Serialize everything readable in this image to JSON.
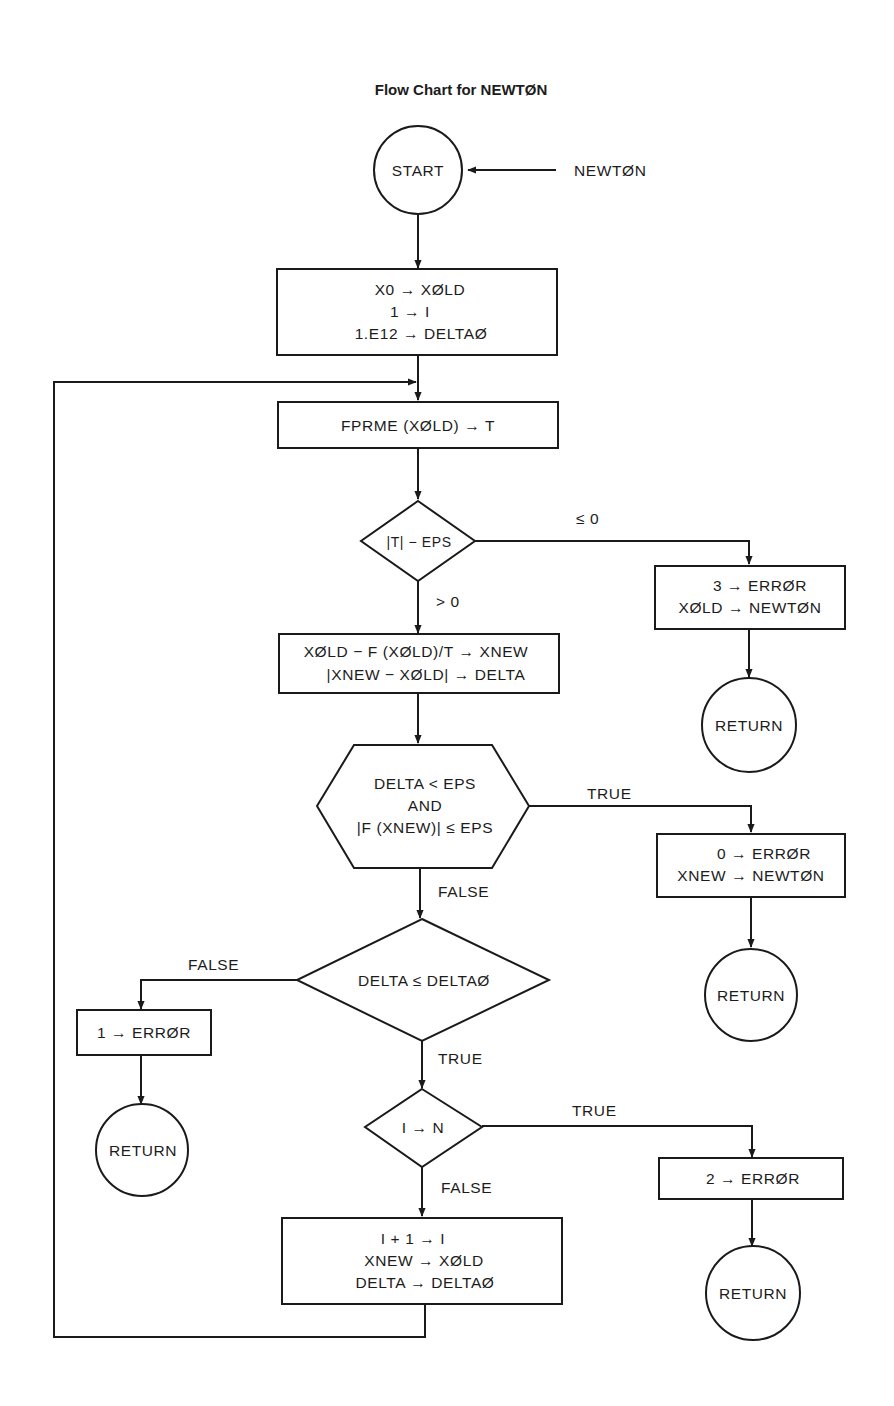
{
  "title": "Flow Chart for NEWTØN",
  "entry_label": "NEWTØN",
  "nodes": {
    "start": {
      "type": "terminal",
      "text": "START"
    },
    "init": {
      "type": "process",
      "lines": [
        "X0 → XØLD",
        "1 → I",
        "1.E12 → DELTAØ"
      ]
    },
    "fprme": {
      "type": "process",
      "lines": [
        "FPRME (XØLD) → T"
      ]
    },
    "check_t": {
      "type": "decision",
      "text": "|T| − EPS"
    },
    "err3": {
      "type": "process",
      "lines": [
        "3 → ERRØR",
        "XØLD → NEWTØN"
      ]
    },
    "return1": {
      "type": "terminal",
      "text": "RETURN"
    },
    "newton_step": {
      "type": "process",
      "lines": [
        "XØLD − F (XØLD)/T → XNEW",
        "|XNEW − XØLD| → DELTA"
      ]
    },
    "converge": {
      "type": "decision",
      "lines": [
        "DELTA < EPS",
        "AND",
        "|F (XNEW)| ≤ EPS"
      ]
    },
    "err0": {
      "type": "process",
      "lines": [
        "0 → ERRØR",
        "XNEW → NEWTØN"
      ]
    },
    "return2": {
      "type": "terminal",
      "text": "RETURN"
    },
    "delta_check": {
      "type": "decision",
      "text": "DELTA ≤ DELTAØ"
    },
    "err1": {
      "type": "process",
      "lines": [
        "1 → ERRØR"
      ]
    },
    "return3": {
      "type": "terminal",
      "text": "RETURN"
    },
    "iter_check": {
      "type": "decision",
      "text": "I → N"
    },
    "err2": {
      "type": "process",
      "lines": [
        "2 → ERRØR"
      ]
    },
    "return4": {
      "type": "terminal",
      "text": "RETURN"
    },
    "update": {
      "type": "process",
      "lines": [
        "I + 1 → I",
        "XNEW → XØLD",
        "DELTA → DELTAØ"
      ]
    }
  },
  "edge_labels": {
    "check_t_le0": "≤ 0",
    "check_t_gt0": "> 0",
    "converge_true": "TRUE",
    "converge_false": "FALSE",
    "delta_false": "FALSE",
    "delta_true": "TRUE",
    "iter_true": "TRUE",
    "iter_false": "FALSE"
  },
  "edges": [
    {
      "from": "entry",
      "to": "start"
    },
    {
      "from": "start",
      "to": "init"
    },
    {
      "from": "init",
      "to": "fprme"
    },
    {
      "from": "fprme",
      "to": "check_t"
    },
    {
      "from": "check_t",
      "to": "err3",
      "label": "≤ 0"
    },
    {
      "from": "err3",
      "to": "return1"
    },
    {
      "from": "check_t",
      "to": "newton_step",
      "label": "> 0"
    },
    {
      "from": "newton_step",
      "to": "converge"
    },
    {
      "from": "converge",
      "to": "err0",
      "label": "TRUE"
    },
    {
      "from": "err0",
      "to": "return2"
    },
    {
      "from": "converge",
      "to": "delta_check",
      "label": "FALSE"
    },
    {
      "from": "delta_check",
      "to": "err1",
      "label": "FALSE"
    },
    {
      "from": "err1",
      "to": "return3"
    },
    {
      "from": "delta_check",
      "to": "iter_check",
      "label": "TRUE"
    },
    {
      "from": "iter_check",
      "to": "err2",
      "label": "TRUE"
    },
    {
      "from": "err2",
      "to": "return4"
    },
    {
      "from": "iter_check",
      "to": "update",
      "label": "FALSE"
    },
    {
      "from": "update",
      "to": "fprme",
      "label": "loop"
    }
  ]
}
